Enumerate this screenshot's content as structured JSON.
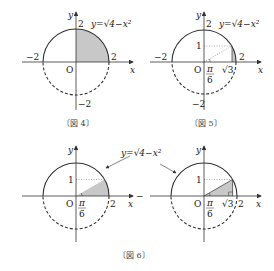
{
  "figures": [
    {
      "id": "fig4",
      "caption": "〔図 4〕",
      "equation": "y=√4−x²",
      "labels": {
        "y_axis": "y",
        "x_axis": "x",
        "origin": "O",
        "top": "2",
        "right": "2",
        "left": "−2",
        "bottom": "−2"
      }
    },
    {
      "id": "fig5",
      "caption": "〔図 5〕",
      "equation": "y=√4−x²",
      "labels": {
        "y_axis": "y",
        "x_axis": "x",
        "origin": "O",
        "top": "2",
        "right": "2",
        "left": "−2",
        "bottom": "−2",
        "one": "1",
        "sqrt3": "√3",
        "angle_num": "π",
        "angle_den": "6"
      }
    },
    {
      "id": "fig6",
      "caption": "〔図 6〕",
      "equation": "y=√4−x²",
      "left": {
        "labels": {
          "y_axis": "y",
          "x_axis": "x",
          "origin": "O",
          "right": "2",
          "one": "1",
          "angle_num": "π",
          "angle_den": "6"
        }
      },
      "right": {
        "labels": {
          "y_axis": "y",
          "x_axis": "x",
          "origin": "O",
          "right": "2",
          "one": "1",
          "sqrt3": "√3",
          "angle_num": "π",
          "angle_den": "6",
          "minus": "−"
        }
      }
    }
  ]
}
